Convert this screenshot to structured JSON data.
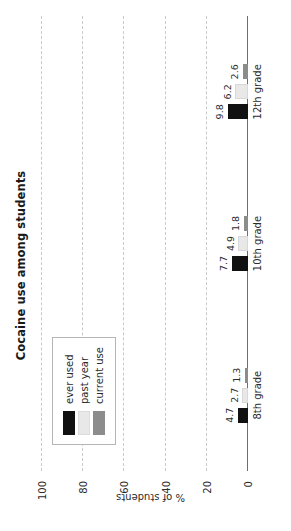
{
  "chart_data": {
    "type": "bar",
    "title": "Cocaine use among students",
    "xlabel": "",
    "ylabel": "% of students",
    "categories": [
      "8th grade",
      "10th grade",
      "12th grade"
    ],
    "series": [
      {
        "name": "ever used",
        "color": "#111111",
        "values": [
          4.7,
          7.7,
          9.8
        ]
      },
      {
        "name": "past year",
        "color": "#e8e8e8",
        "values": [
          2.7,
          4.9,
          6.2
        ]
      },
      {
        "name": "current use",
        "color": "#8c8c8c",
        "values": [
          1.3,
          1.8,
          2.6
        ]
      }
    ],
    "ylim": [
      0,
      100
    ],
    "yticks": [
      0,
      20,
      40,
      60,
      80,
      100
    ],
    "ytick_labels": [
      "0",
      "20",
      "40",
      "60",
      "80",
      "100"
    ],
    "grid": true,
    "grid_style": "dashed-horizontal",
    "legend_position": "upper-left",
    "orientation": "vertical-bars-rotated-90ccw",
    "data_labels": [
      "4.7",
      "2.7",
      "1.3",
      "7.7",
      "4.9",
      "1.8",
      "9.8",
      "6.2",
      "2.6"
    ]
  },
  "legend": {
    "items": [
      {
        "label": "ever used"
      },
      {
        "label": "past year"
      },
      {
        "label": "current use"
      }
    ]
  }
}
